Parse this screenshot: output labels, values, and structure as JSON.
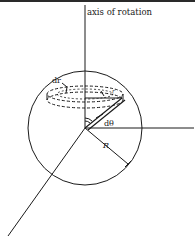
{
  "figure": {
    "labels": {
      "axis": "axis of rotation",
      "dr": "dr",
      "dtheta": "dθ",
      "R": "R",
      "r": "r"
    },
    "colors": {
      "stroke": "#1a1a1a",
      "background": "#ffffff"
    }
  }
}
